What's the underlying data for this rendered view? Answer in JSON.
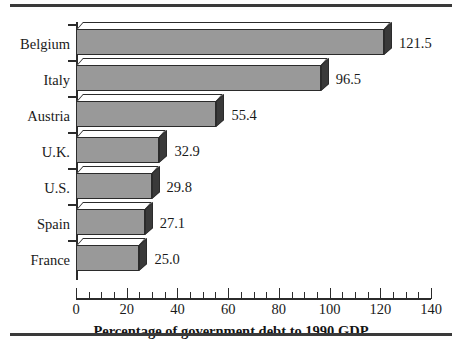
{
  "chart_data": {
    "type": "bar",
    "orientation": "horizontal",
    "title": "",
    "xlabel": "Percentage of government debt to 1990 GDP",
    "ylabel": "",
    "categories": [
      "Belgium",
      "Italy",
      "Austria",
      "U.K.",
      "U.S.",
      "Spain",
      "France"
    ],
    "values": [
      121.5,
      96.5,
      55.4,
      32.9,
      29.8,
      27.1,
      25.0
    ],
    "value_labels": [
      "121.5",
      "96.5",
      "55.4",
      "32.9",
      "29.8",
      "27.1",
      "25.0"
    ],
    "xlim": [
      0,
      140
    ],
    "xticks": [
      0,
      20,
      40,
      60,
      80,
      100,
      120,
      140
    ],
    "xtick_labels": [
      "0",
      "20",
      "40",
      "60",
      "80",
      "100",
      "120",
      "140"
    ],
    "minor_tick_step": 5,
    "grid": false,
    "legend": false,
    "style": "3d-shadow-bars",
    "colors": {
      "bar_face": "#999999",
      "bar_top": "#ffffff",
      "bar_side": "#3a3a3a",
      "outline": "#2b2b2b",
      "text": "#1a1a1a",
      "background": "#ffffff",
      "rule": "#3a3a3a"
    }
  },
  "figure": {
    "top_rule": "",
    "bottom_rule": "",
    "axis_title": "Percentage of government debt to 1990 GDP"
  }
}
